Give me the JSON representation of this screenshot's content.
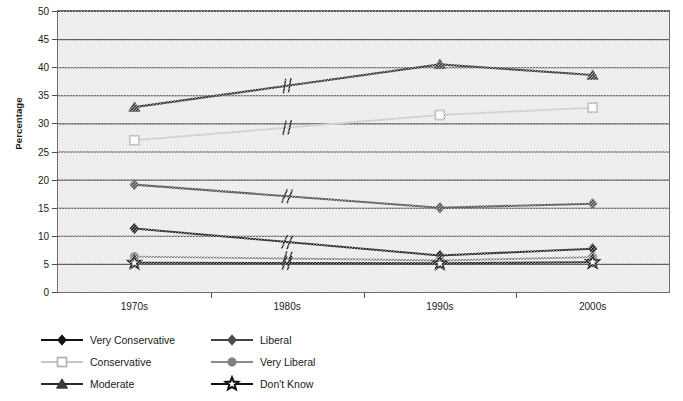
{
  "chart_data": {
    "type": "line",
    "title": "",
    "xlabel": "",
    "ylabel": "Percentage",
    "categories": [
      "1970s",
      "1980s",
      "1990s",
      "2000s"
    ],
    "ylim": [
      0,
      50
    ],
    "yticks": [
      0,
      5,
      10,
      15,
      20,
      25,
      30,
      35,
      40,
      45,
      50
    ],
    "grid": true,
    "legend_position": "bottom-left",
    "note": "No data markers are plotted for the 1980s; each series line carries an axis-break mark (//) at that decade.",
    "series": [
      {
        "name": "Very Conservative",
        "marker": "filled-diamond",
        "color": "#141414",
        "line_color": "#141414",
        "values": [
          11.3,
          null,
          6.5,
          7.7
        ]
      },
      {
        "name": "Conservative",
        "marker": "open-square",
        "color": "#d2d2d2",
        "line_color": "#c6c6c6",
        "values": [
          27.0,
          null,
          31.5,
          32.8
        ]
      },
      {
        "name": "Moderate",
        "marker": "filled-triangle",
        "color": "#3a3a3a",
        "line_color": "#2b2b2b",
        "values": [
          32.9,
          null,
          40.5,
          38.6
        ]
      },
      {
        "name": "Liberal",
        "marker": "filled-diamond",
        "color": "#4d4d4d",
        "line_color": "#444444",
        "values": [
          19.1,
          null,
          15.0,
          15.7
        ]
      },
      {
        "name": "Very Liberal",
        "marker": "filled-circle",
        "color": "#808080",
        "line_color": "#8a8a8a",
        "values": [
          6.3,
          null,
          5.6,
          6.2
        ]
      },
      {
        "name": "Don't Know",
        "marker": "open-star",
        "color": "#ffffff",
        "line_color": "#141414",
        "values": [
          5.2,
          null,
          5.1,
          5.3
        ]
      }
    ]
  },
  "axis": {
    "y_title": "Percentage"
  }
}
